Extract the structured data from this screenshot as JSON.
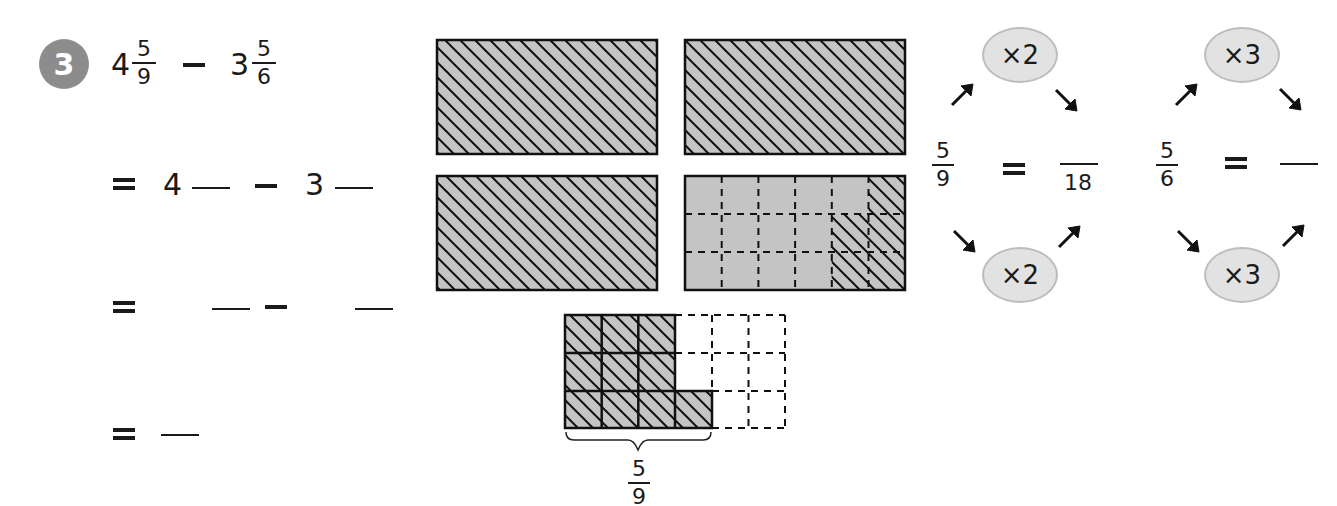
{
  "problem": {
    "number": "3",
    "badge_color": "#8c8c8c",
    "line1": {
      "whole_a": "4",
      "num_a": "5",
      "den_a": "9",
      "operator": "−",
      "whole_b": "3",
      "num_b": "5",
      "den_b": "6"
    },
    "line2": {
      "equals": "=",
      "whole_a": "4",
      "operator": "−",
      "whole_b": "3"
    },
    "line3": {
      "equals": "=",
      "operator": "−"
    },
    "line4": {
      "equals": "="
    }
  },
  "diagram": {
    "fill_color": "#c4c4c4",
    "rects": [
      {
        "label": "whole-1",
        "hatched": "full"
      },
      {
        "label": "whole-2",
        "hatched": "full"
      },
      {
        "label": "whole-3",
        "hatched": "full"
      },
      {
        "label": "whole-4-partial",
        "grid": "6x3",
        "hatched_cells": 5
      }
    ],
    "lower_grid": {
      "grid": "6x3",
      "shaded_cells": 10
    },
    "brace_label": {
      "num": "5",
      "den": "9"
    }
  },
  "conversions": [
    {
      "num": "5",
      "den": "9",
      "equals": "=",
      "multiplier_top": "×2",
      "multiplier_bottom": "×2",
      "result_den": "18"
    },
    {
      "num": "5",
      "den": "6",
      "equals": "=",
      "multiplier_top": "×3",
      "multiplier_bottom": "×3",
      "result_den": ""
    }
  ]
}
